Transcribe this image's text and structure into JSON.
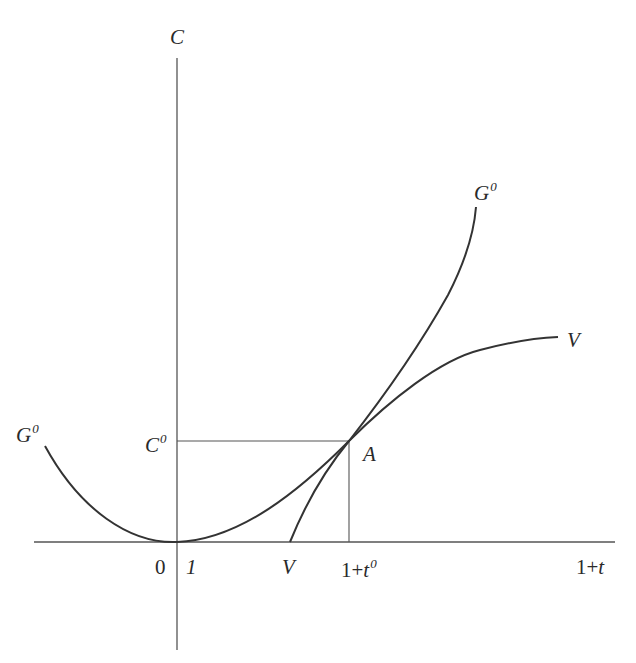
{
  "figure": {
    "title_partial": "",
    "axes": {
      "y_label": "C",
      "x_label": "1+t",
      "origin_label": "0",
      "x_mark_one": "1",
      "x_mark_V": "V",
      "x_mark_t0_base": "1+t",
      "x_mark_t0_sup": "0",
      "y_mark_C0_base": "C",
      "y_mark_C0_sup": "0"
    },
    "curves": {
      "G0_left_base": "G",
      "G0_left_sup": "0",
      "G0_right_base": "G",
      "G0_right_sup": "0",
      "V_right": "V"
    },
    "point_A": "A",
    "colors": {
      "line": "#333333",
      "thin_line": "#555555"
    }
  }
}
